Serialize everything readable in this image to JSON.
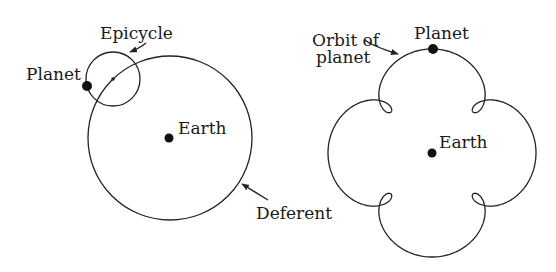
{
  "left_figure": {
    "labels": {
      "epicycle": "Epicycle",
      "planet": "Planet",
      "earth": "Earth",
      "deferent": "Deferent"
    },
    "deferent": {
      "cx": 170,
      "cy": 138,
      "r": 82
    },
    "epicycle": {
      "cx": 113,
      "cy": 79,
      "r": 27
    },
    "planet_dot": {
      "cx": 87,
      "cy": 86,
      "r": 5
    },
    "earth_dot": {
      "cx": 169,
      "cy": 138,
      "r": 4.5
    }
  },
  "right_figure": {
    "labels": {
      "orbit_line1": "Orbit of",
      "orbit_line2": "planet",
      "planet": "Planet",
      "earth": "Earth"
    },
    "center": {
      "cx": 432,
      "cy": 153
    },
    "deferent_radius": 81,
    "epicycle_radius": 23,
    "epicycle_speed": 5,
    "planet_dot": {
      "cx": 433,
      "cy": 49,
      "r": 5
    },
    "earth_dot": {
      "cx": 432,
      "cy": 153,
      "r": 4.5
    }
  },
  "colors": {
    "ink": "#1a1a1a",
    "background": "#ffffff"
  }
}
